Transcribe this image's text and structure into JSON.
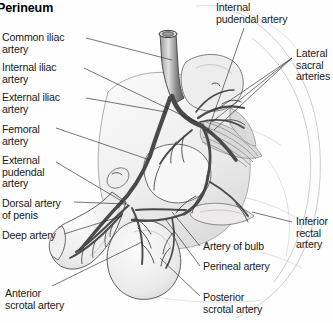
{
  "figure": {
    "title": "Perineum",
    "style": "grayscale-medical-illustration"
  },
  "labels": {
    "left": [
      {
        "id": "common-iliac-artery",
        "text": "Common iliac\nartery",
        "x": 2,
        "y": 32
      },
      {
        "id": "internal-iliac-artery",
        "text": "Internal iliac\nartery",
        "x": 2,
        "y": 62
      },
      {
        "id": "external-iliac-artery",
        "text": "External iliac\nartery",
        "x": 2,
        "y": 92
      },
      {
        "id": "femoral-artery",
        "text": "Femoral\nartery",
        "x": 2,
        "y": 124
      },
      {
        "id": "external-pudendal-artery",
        "text": "External\npudendal\nartery",
        "x": 2,
        "y": 155
      },
      {
        "id": "dorsal-artery-of-penis",
        "text": "Dorsal artery\nof penis",
        "x": 2,
        "y": 198
      },
      {
        "id": "deep-artery",
        "text": "Deep artery",
        "x": 2,
        "y": 230
      },
      {
        "id": "anterior-scrotal-artery",
        "text": "Anterior\nscrotal artery",
        "x": 5,
        "y": 288
      }
    ],
    "right": [
      {
        "id": "internal-pudendal-artery",
        "text": "Internal\npudendal artery",
        "x": 216,
        "y": 2
      },
      {
        "id": "lateral-sacral-arteries",
        "text": "Lateral\nsacral\narteries",
        "x": 296,
        "y": 48
      },
      {
        "id": "inferior-rectal-artery",
        "text": "Inferior\nrectal\nartery",
        "x": 296,
        "y": 216
      },
      {
        "id": "artery-of-bulb",
        "text": "Artery of bulb",
        "x": 203,
        "y": 241
      },
      {
        "id": "perineal-artery",
        "text": "Perineal artery",
        "x": 203,
        "y": 261
      },
      {
        "id": "posterior-scrotal-artery",
        "text": "Posterior\nscrotal artery",
        "x": 203,
        "y": 292
      }
    ]
  },
  "colors": {
    "background": "#fefefe",
    "text": "#1a1a1a",
    "leader_line": "#2b2b2b",
    "artery_stroke": "#4a4a4a",
    "skin_fill": "#f2f1f1",
    "bone_fill": "#eeeded",
    "muscle_fill": "#d9d8d8"
  },
  "structures": [
    {
      "name": "aorta-trunk",
      "note": "vertical great vessel descending from top"
    },
    {
      "name": "iliac-bifurcation",
      "note": "branching into common/internal/external iliac"
    },
    {
      "name": "sacrum",
      "note": "bone block at upper right"
    },
    {
      "name": "pelvic-outline",
      "note": "large pale pelvic/buttock contour"
    },
    {
      "name": "penis-shaft",
      "note": "curved pendulous shaft to lower left"
    },
    {
      "name": "scrotum",
      "note": "rounded sac below penis"
    },
    {
      "name": "thigh-contour",
      "note": "large sweeping arcs on right side"
    }
  ]
}
